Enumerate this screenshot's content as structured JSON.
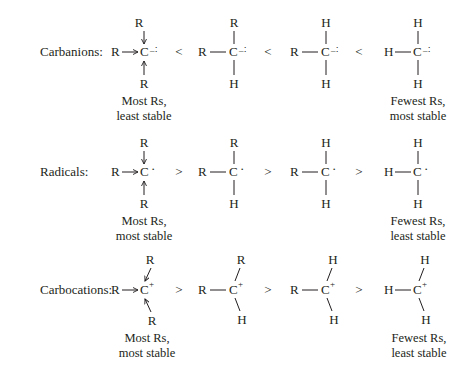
{
  "rows": [
    {
      "label": "Carbanions:",
      "charge": "–∶",
      "comparator": "<",
      "structures": [
        {
          "top": "R",
          "left": "R",
          "center": "C",
          "bottom": "R",
          "bond_style": "arrow"
        },
        {
          "top": "R",
          "left": "R",
          "center": "C",
          "bottom": "H",
          "bond_style": "line"
        },
        {
          "top": "H",
          "left": "R",
          "center": "C",
          "bottom": "H",
          "bond_style": "line"
        },
        {
          "top": "H",
          "left": "H",
          "center": "C",
          "bottom": "H",
          "bond_style": "line"
        }
      ],
      "left_note": [
        "Most Rs,",
        "least stable"
      ],
      "right_note": [
        "Fewest Rs,",
        "most stable"
      ]
    },
    {
      "label": "Radicals:",
      "charge": "·",
      "comparator": ">",
      "structures": [
        {
          "top": "R",
          "left": "R",
          "center": "C",
          "bottom": "R",
          "bond_style": "arrow"
        },
        {
          "top": "R",
          "left": "R",
          "center": "C",
          "bottom": "H",
          "bond_style": "line"
        },
        {
          "top": "H",
          "left": "R",
          "center": "C",
          "bottom": "H",
          "bond_style": "line"
        },
        {
          "top": "H",
          "left": "H",
          "center": "C",
          "bottom": "H",
          "bond_style": "line"
        }
      ],
      "left_note": [
        "Most Rs,",
        "most stable"
      ],
      "right_note": [
        "Fewest Rs,",
        "least stable"
      ]
    },
    {
      "label": "Carbocations:",
      "charge": "+",
      "comparator": ">",
      "structures": [
        {
          "top": "R",
          "left": "R",
          "center": "C",
          "bottom": "R",
          "bond_style": "arrow"
        },
        {
          "top": "R",
          "left": "R",
          "center": "C",
          "bottom": "H",
          "bond_style": "line"
        },
        {
          "top": "H",
          "left": "R",
          "center": "C",
          "bottom": "H",
          "bond_style": "line"
        },
        {
          "top": "H",
          "left": "H",
          "center": "C",
          "bottom": "H",
          "bond_style": "line"
        }
      ],
      "left_note": [
        "Most Rs,",
        "most stable"
      ],
      "right_note": [
        "Fewest Rs,",
        "least stable"
      ]
    }
  ]
}
